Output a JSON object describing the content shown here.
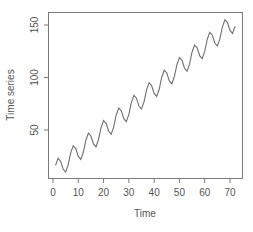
{
  "chart_data": {
    "type": "line",
    "title": "",
    "xlabel": "Time",
    "ylabel": "Time series",
    "xlim": [
      -1.5,
      75
    ],
    "ylim": [
      3,
      162
    ],
    "xticks": [
      0,
      10,
      20,
      30,
      40,
      50,
      60,
      70
    ],
    "yticks": [
      50,
      100,
      150
    ],
    "grid": false,
    "legend": null,
    "line_color": "#6e6e6e",
    "axis_color": "#7a7a7a",
    "series": [
      {
        "name": "Time series",
        "x": [
          1,
          2,
          3,
          4,
          5,
          6,
          7,
          8,
          9,
          10,
          11,
          12,
          13,
          14,
          15,
          16,
          17,
          18,
          19,
          20,
          21,
          22,
          23,
          24,
          25,
          26,
          27,
          28,
          29,
          30,
          31,
          32,
          33,
          34,
          35,
          36,
          37,
          38,
          39,
          40,
          41,
          42,
          43,
          44,
          45,
          46,
          47,
          48,
          49,
          50,
          51,
          52,
          53,
          54,
          55,
          56,
          57,
          58,
          59,
          60,
          61,
          62,
          63,
          64,
          65,
          66,
          67,
          68,
          69,
          70,
          71,
          72
        ],
        "values": [
          16.3,
          23.0,
          20.3,
          12.8,
          10.0,
          16.8,
          28.3,
          35.0,
          32.3,
          24.8,
          22.0,
          28.8,
          40.3,
          47.0,
          44.3,
          36.8,
          34.0,
          40.8,
          52.3,
          59.0,
          56.3,
          48.8,
          46.0,
          52.8,
          64.3,
          71.0,
          68.3,
          60.8,
          58.0,
          64.8,
          76.3,
          83.0,
          80.3,
          72.8,
          70.0,
          76.8,
          88.3,
          95.0,
          92.3,
          84.8,
          82.0,
          88.8,
          100.3,
          107.0,
          104.3,
          96.8,
          94.0,
          100.8,
          112.3,
          119.0,
          116.3,
          108.8,
          106.0,
          112.8,
          124.3,
          131.0,
          128.3,
          120.8,
          118.0,
          124.8,
          136.3,
          143.0,
          140.3,
          132.8,
          130.0,
          136.8,
          148.3,
          155.0,
          152.3,
          144.8,
          142.0,
          148.8
        ]
      }
    ]
  }
}
